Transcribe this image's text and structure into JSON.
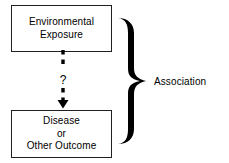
{
  "diagram": {
    "background_color": "#ffffff",
    "stroke_color": "#231f20",
    "text_color": "#000000",
    "nodes": [
      {
        "id": "exposure",
        "lines": [
          "Environmental",
          "Exposure"
        ]
      },
      {
        "id": "outcome",
        "lines": [
          "Disease",
          "or",
          "Other Outcome"
        ]
      }
    ],
    "connector": {
      "style": "dashed-arrow",
      "direction": "downward",
      "label": "?"
    },
    "brace": {
      "glyph": "right-curly-brace",
      "label": "Association"
    }
  }
}
